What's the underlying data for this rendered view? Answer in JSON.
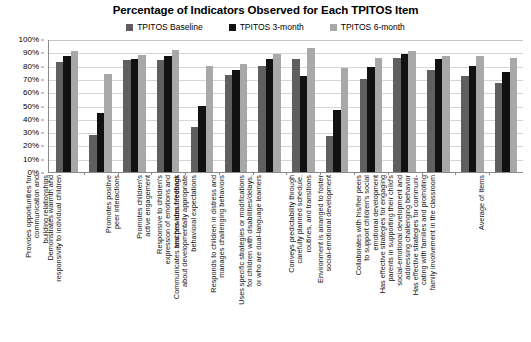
{
  "chart_data": {
    "type": "bar",
    "title": "Percentage of Indicators Observed for Each TPITOS Item",
    "xlabel": "",
    "ylabel": "",
    "ylim": [
      0,
      100
    ],
    "ytick_labels": [
      "100%",
      "90%",
      "80%",
      "70%",
      "60%",
      "50%",
      "40%",
      "30%",
      "20%",
      "10%",
      "0%"
    ],
    "ytick_values": [
      100,
      90,
      80,
      70,
      60,
      50,
      40,
      30,
      20,
      10,
      0
    ],
    "grid": true,
    "legend_position": "top-center",
    "orientation": "vertical",
    "grouping": "grouped",
    "categories": [
      "Provides opportunities for communication and building relationships",
      "Demonstrates warmth and responsivity to individual children",
      "Promotes positive peer interactions",
      "Promotes children's active engagement",
      "Responsive to children's expression of emotions and teaches about feelings",
      "Communicates and provides feedback about developmentally appropriate behavioral expectations",
      "Responds to children in distress and manages challenging behaviors",
      "Uses specific strategies or modifications for children with disabilities/delays, or who are dual-language learners",
      "Conveys predictability through carefully planned schedule, routines, and transitions",
      "Environment is arranged to foster social-emotional development",
      "Collaborates with his/her peers to support children's social emotional development",
      "Has effective strategies for engaging parents in supporting their child's social-emotional development and addressing challenging behavior",
      "Has effective strategies for communicating with families and promoting family involvement in the classroom",
      "Average of Items"
    ],
    "category_lines": [
      [
        "Provides opportunities for",
        "communication and",
        "building relationships"
      ],
      [
        "Demonstrates warmth and",
        "responsivity to individual children"
      ],
      [
        "Promotes positive",
        "peer interactions"
      ],
      [
        "Promotes children's",
        "active engagement"
      ],
      [
        "Responsive to children's",
        "expression of emotions and",
        "teaches about feelings"
      ],
      [
        "Communicates and provides feedback",
        "about developmentally appropriate",
        "behavioral expectations"
      ],
      [
        "Responds to children in distress and",
        "manages challenging behaviors"
      ],
      [
        "Uses specific strategies or modifications",
        "for children with disabilities/delays,",
        "or who are dual-language learners"
      ],
      [
        "Conveys predictability through",
        "carefully planned schedule,",
        "routines, and transitions"
      ],
      [
        "Environment is arranged to foster",
        "social-emotional development"
      ],
      [
        "Collaborates with his/her peers",
        "to support children's social",
        "emotional development"
      ],
      [
        "Has effective strategies for engaging",
        "parents in supporting their child's",
        "social-emotional development and",
        "addressing challenging behavior"
      ],
      [
        "Has effective strategies for communi-",
        "cating with families and promoting",
        "family involvement in the classroom"
      ],
      [
        "Average of Items"
      ]
    ],
    "series": [
      {
        "name": "TPITOS Baseline",
        "color": "#5f5f5f",
        "values": [
          83,
          28,
          84,
          84,
          34,
          73,
          80,
          85,
          27,
          70,
          86,
          77,
          72,
          67
        ]
      },
      {
        "name": "TPITOS 3-month",
        "color": "#111111",
        "values": [
          87,
          44,
          85,
          87,
          50,
          77,
          85,
          72,
          47,
          79,
          89,
          85,
          80,
          75
        ]
      },
      {
        "name": "TPITOS 6-month",
        "color": "#a8a8a8",
        "values": [
          91,
          74,
          88,
          92,
          80,
          81,
          89,
          93,
          78,
          86,
          91,
          87,
          87,
          86
        ]
      }
    ]
  },
  "legend": {
    "items": [
      {
        "label": "TPITOS Baseline",
        "color": "#5f5f5f"
      },
      {
        "label": "TPITOS 3-month",
        "color": "#111111"
      },
      {
        "label": "TPITOS 6-month",
        "color": "#a8a8a8"
      }
    ]
  }
}
